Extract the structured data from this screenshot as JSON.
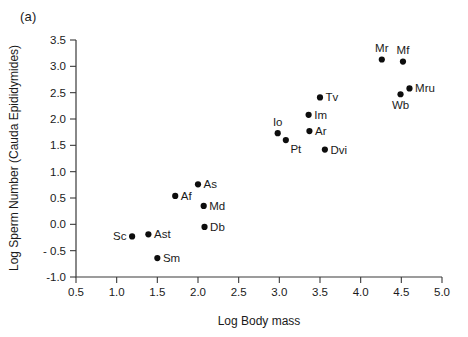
{
  "figure": {
    "panel_label": "(a)"
  },
  "chart_data": {
    "type": "scatter",
    "title": "",
    "xlabel": "Log Body mass",
    "ylabel": "Log Sperm Number (Cauda Epididymides)",
    "xlim": [
      0.5,
      5.0
    ],
    "ylim": [
      -1.0,
      3.5
    ],
    "xticks": [
      "0.5",
      "1.0",
      "1.5",
      "2.0",
      "2.5",
      "3.0",
      "3.5",
      "4.0",
      "4.5",
      "5.0"
    ],
    "xtick_values": [
      0.5,
      1.0,
      1.5,
      2.0,
      2.5,
      3.0,
      3.5,
      4.0,
      4.5,
      5.0
    ],
    "yticks": [
      "3.5",
      "3.0",
      "2.5",
      "2.0",
      "1.5",
      "1.0",
      "0.5",
      "0.0",
      "- 0.5",
      "-1.0"
    ],
    "ytick_values": [
      3.5,
      3.0,
      2.5,
      2.0,
      1.5,
      1.0,
      0.5,
      0.0,
      -0.5,
      -1.0
    ],
    "grid": false,
    "legend": false,
    "marker_color": "#0d0d0d",
    "axis_color": "#3a3a3a",
    "points": [
      {
        "label": "Mr",
        "x": 4.26,
        "y": 3.13,
        "label_pos": "above"
      },
      {
        "label": "Mf",
        "x": 4.52,
        "y": 3.09,
        "label_pos": "above"
      },
      {
        "label": "Mru",
        "x": 4.6,
        "y": 2.58,
        "label_pos": "right"
      },
      {
        "label": "Wb",
        "x": 4.49,
        "y": 2.47,
        "label_pos": "below"
      },
      {
        "label": "Tv",
        "x": 3.5,
        "y": 2.41,
        "label_pos": "right"
      },
      {
        "label": "Im",
        "x": 3.36,
        "y": 2.08,
        "label_pos": "right"
      },
      {
        "label": "Ar",
        "x": 3.37,
        "y": 1.77,
        "label_pos": "right"
      },
      {
        "label": "Io",
        "x": 2.98,
        "y": 1.73,
        "label_pos": "above"
      },
      {
        "label": "Pt",
        "x": 3.08,
        "y": 1.6,
        "label_pos": "below-right"
      },
      {
        "label": "Dvi",
        "x": 3.56,
        "y": 1.42,
        "label_pos": "right"
      },
      {
        "label": "As",
        "x": 2.0,
        "y": 0.76,
        "label_pos": "right"
      },
      {
        "label": "Af",
        "x": 1.72,
        "y": 0.54,
        "label_pos": "right"
      },
      {
        "label": "Md",
        "x": 2.07,
        "y": 0.35,
        "label_pos": "right"
      },
      {
        "label": "Db",
        "x": 2.08,
        "y": -0.05,
        "label_pos": "right"
      },
      {
        "label": "Ast",
        "x": 1.39,
        "y": -0.19,
        "label_pos": "right"
      },
      {
        "label": "Sc",
        "x": 1.19,
        "y": -0.23,
        "label_pos": "left"
      },
      {
        "label": "Sm",
        "x": 1.5,
        "y": -0.64,
        "label_pos": "right"
      }
    ]
  }
}
